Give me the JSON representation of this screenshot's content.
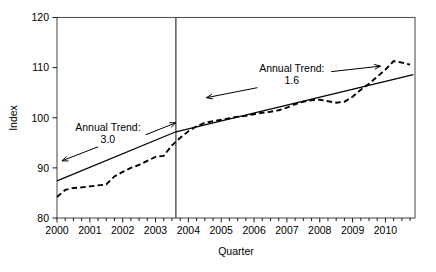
{
  "chart_data": {
    "type": "line",
    "title": "",
    "xlabel": "Quarter",
    "ylabel": "Index",
    "ylim": [
      80,
      120
    ],
    "yticks": [
      80,
      90,
      100,
      110,
      120
    ],
    "ytick_labels": [
      "80",
      "90",
      "100",
      "110",
      "120"
    ],
    "xlim": [
      2000.0,
      2010.9
    ],
    "xticks": [
      2000,
      2001,
      2002,
      2003,
      2004,
      2005,
      2006,
      2007,
      2008,
      2009,
      2010
    ],
    "xtick_labels": [
      "2000",
      "2001",
      "2002",
      "2003",
      "2004",
      "2005",
      "2006",
      "2007",
      "2008",
      "2009",
      "2010"
    ],
    "minor_tick_interval": 0.25,
    "grid": false,
    "legend": "none",
    "series": [
      {
        "name": "Index (quarterly)",
        "style": "dashed",
        "x": [
          2000.0,
          2000.25,
          2000.5,
          2000.75,
          2001.0,
          2001.25,
          2001.5,
          2001.75,
          2002.0,
          2002.25,
          2002.5,
          2002.75,
          2003.0,
          2003.25,
          2003.5,
          2003.75,
          2004.0,
          2004.25,
          2004.5,
          2004.75,
          2005.0,
          2005.25,
          2005.5,
          2005.75,
          2006.0,
          2006.25,
          2006.5,
          2006.75,
          2007.0,
          2007.25,
          2007.5,
          2007.75,
          2008.0,
          2008.25,
          2008.5,
          2008.75,
          2009.0,
          2009.25,
          2009.5,
          2009.75,
          2010.0,
          2010.25,
          2010.5,
          2010.75
        ],
        "values": [
          84.2,
          85.6,
          86.0,
          86.1,
          86.3,
          86.5,
          86.7,
          88.3,
          89.2,
          90.0,
          90.6,
          91.4,
          92.2,
          92.4,
          94.5,
          96.0,
          97.3,
          98.3,
          99.0,
          99.3,
          99.6,
          99.9,
          100.2,
          100.4,
          100.7,
          101.0,
          101.2,
          101.5,
          102.0,
          102.7,
          103.2,
          103.5,
          103.6,
          103.3,
          103.0,
          103.2,
          104.2,
          105.6,
          106.8,
          108.2,
          109.6,
          111.3,
          111.0,
          110.6
        ]
      },
      {
        "name": "Trend segment 1",
        "style": "solid",
        "x": [
          2000.0,
          2003.62
        ],
        "values": [
          87.4,
          97.2
        ]
      },
      {
        "name": "Trend segment 2",
        "style": "solid",
        "x": [
          2003.62,
          2010.85
        ],
        "values": [
          97.2,
          108.6
        ]
      }
    ],
    "break_line_x": 2003.62,
    "annotations": [
      {
        "name": "annual-trend-left",
        "line1": "Annual Trend:",
        "line2": "3.0",
        "x": 2001.55,
        "y": 97.3
      },
      {
        "name": "annual-trend-right",
        "line1": "Annual Trend:",
        "line2": "1.6",
        "x": 2007.15,
        "y": 109.1
      }
    ],
    "arrows": [
      {
        "name": "arrow-left-down",
        "x1": 2001.25,
        "y1": 94.2,
        "x2": 2000.15,
        "y2": 91.4
      },
      {
        "name": "arrow-left-up",
        "x1": 2002.7,
        "y1": 96.6,
        "x2": 2003.62,
        "y2": 99.0
      },
      {
        "name": "arrow-right-down",
        "x1": 2006.1,
        "y1": 106.0,
        "x2": 2004.55,
        "y2": 104.0
      },
      {
        "name": "arrow-right-up",
        "x1": 2008.35,
        "y1": 109.2,
        "x2": 2009.85,
        "y2": 110.3
      }
    ]
  }
}
